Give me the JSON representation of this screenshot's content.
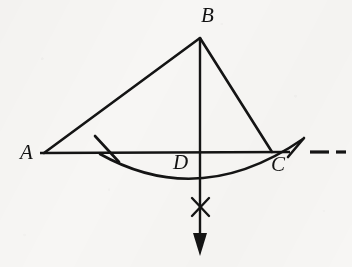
{
  "figure": {
    "kind": "geometry-construction-diagram",
    "caption_text": "",
    "background_color": "#f7f6f4",
    "stroke_color": "#141414",
    "label_color": "#131313",
    "canvas": {
      "width": 352,
      "height": 267
    },
    "labels": [
      {
        "id": "A",
        "text": "A",
        "x": 20,
        "y": 142,
        "font_size": 21
      },
      {
        "id": "B",
        "text": "B",
        "x": 201,
        "y": 5,
        "font_size": 21
      },
      {
        "id": "D",
        "text": "D",
        "x": 173,
        "y": 152,
        "font_size": 21
      },
      {
        "id": "C",
        "text": "C",
        "x": 271,
        "y": 154,
        "font_size": 21
      }
    ],
    "points": {
      "A": {
        "x": 44,
        "y": 153
      },
      "B": {
        "x": 200,
        "y": 38
      },
      "C": {
        "x": 272,
        "y": 152
      },
      "D": {
        "x": 200,
        "y": 153
      }
    },
    "segments": [
      {
        "name": "side-AB",
        "x1": 44,
        "y1": 153,
        "x2": 200,
        "y2": 38,
        "width": 2.6
      },
      {
        "name": "side-BC",
        "x1": 200,
        "y1": 38,
        "x2": 272,
        "y2": 152,
        "width": 2.6
      },
      {
        "name": "base-AC",
        "x1": 40,
        "y1": 153,
        "x2": 290,
        "y2": 152,
        "width": 2.4
      },
      {
        "name": "altitude-BD-arrow",
        "x1": 200,
        "y1": 38,
        "x2": 200,
        "y2": 236,
        "width": 2.4
      },
      {
        "name": "compass-tick-left",
        "x1": 95,
        "y1": 136,
        "x2": 119,
        "y2": 162,
        "width": 2.6
      },
      {
        "name": "compass-tick-right",
        "x1": 288,
        "y1": 157,
        "x2": 304,
        "y2": 138,
        "width": 2.6
      },
      {
        "name": "x-mark-stroke-1",
        "x1": 192,
        "y1": 198,
        "x2": 209,
        "y2": 216,
        "width": 2.4
      },
      {
        "name": "x-mark-stroke-2",
        "x1": 209,
        "y1": 198,
        "x2": 192,
        "y2": 216,
        "width": 2.4
      }
    ],
    "arc": {
      "name": "compass-arc-below-base",
      "path": "M 100 154 Q 200 210 303 139",
      "width": 2.6
    },
    "arrow_head": {
      "name": "downward-arrowhead",
      "tip_x": 200,
      "tip_y": 256,
      "base_y": 233,
      "half_width": 7
    },
    "dashes": [
      {
        "name": "extension-dash-1",
        "x1": 310,
        "y1": 152,
        "x2": 329,
        "y2": 152,
        "width": 3.2
      },
      {
        "name": "extension-dash-2",
        "x1": 336,
        "y1": 152,
        "x2": 346,
        "y2": 152,
        "width": 3.2
      }
    ]
  }
}
